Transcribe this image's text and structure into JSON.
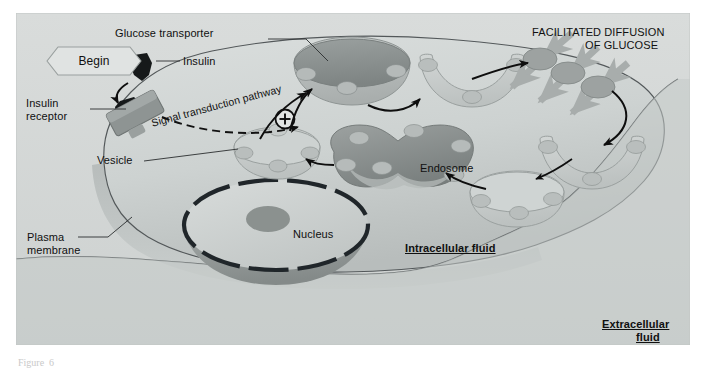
{
  "figure": {
    "domain": "biology-diagram",
    "title_caption": "Figure  6",
    "panel_bg": "#d8dbd9",
    "ink": "#101010",
    "membrane_line": "#4a4f52",
    "cytosol": "#cfd3d2",
    "organelle_dark": "#8d9291",
    "organelle_light": "#b9bdbc",
    "protein_dot": "#a5aaa9",
    "glucose_arrow": "#a8adac"
  },
  "badges": {
    "begin": "Begin",
    "plus": "+"
  },
  "labels": {
    "glucose_transporter": "Glucose transporter",
    "insulin": "Insulin",
    "insulin_receptor_line1": "Insulin",
    "insulin_receptor_line2": "receptor",
    "signal_pathway": "Signal transduction pathway",
    "vesicle": "Vesicle",
    "endosome": "Endosome",
    "nucleus": "Nucleus",
    "plasma_membrane_line1": "Plasma",
    "plasma_membrane_line2": "membrane",
    "facilitated_line1": "FACILITATED DIFFUSION",
    "facilitated_line2": "OF GLUCOSE",
    "intracellular_fluid": "Intracellular fluid",
    "extracellular_line1": "Extracellular",
    "extracellular_line2": "fluid"
  },
  "structures": [
    {
      "name": "insulin-hormone",
      "kind": "ligand",
      "count": 2
    },
    {
      "name": "insulin-receptor",
      "kind": "membrane-protein",
      "count": 1
    },
    {
      "name": "vesicle-cytosolic",
      "kind": "vesicle",
      "count": 1
    },
    {
      "name": "vesicle-docking",
      "kind": "vesicle",
      "count": 1
    },
    {
      "name": "vesicle-fusing",
      "kind": "vesicle",
      "count": 1
    },
    {
      "name": "vesicle-endocytic",
      "kind": "vesicle",
      "count": 1
    },
    {
      "name": "vesicle-recycling",
      "kind": "vesicle",
      "count": 1
    },
    {
      "name": "endosome",
      "kind": "organelle",
      "count": 1
    },
    {
      "name": "nucleus",
      "kind": "organelle",
      "count": 1
    },
    {
      "name": "glucose-transporter-in-membrane",
      "kind": "membrane-protein",
      "count": 3
    }
  ],
  "flow_steps": [
    "Insulin binds insulin receptor",
    "Signal transduction pathway activates (+) vesicle trafficking",
    "Vesicle carrying glucose transporters moves to plasma membrane",
    "Vesicle fuses, inserting glucose transporters into membrane",
    "Facilitated diffusion of glucose into cell",
    "Transporters are endocytosed into vesicle",
    "Vesicle returns transporters to endosome for recycling"
  ]
}
